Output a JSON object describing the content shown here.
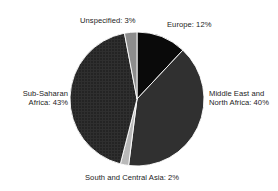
{
  "chart_data": {
    "type": "pie",
    "title": "",
    "subtitle": "",
    "xlabel": "",
    "ylabel": "",
    "legend_position": "none",
    "grid": false,
    "unit": "%",
    "total": 100,
    "start_angle_deg": 0,
    "direction": "clockwise",
    "categories": [
      "Europe",
      "Middle East and North Africa",
      "South and Central Asia",
      "Sub-Saharan Africa",
      "Unspecified"
    ],
    "values": [
      12,
      40,
      2,
      43,
      3
    ],
    "slices": [
      {
        "name": "Europe",
        "label": "Europe: 12%",
        "value": 12,
        "color": "#0a0a0a",
        "pattern": "solid",
        "start_deg": 0,
        "end_deg": 43.2
      },
      {
        "name": "Middle East and North Africa",
        "label_line1": "Middle East and",
        "label_line2": "North Africa: 40%",
        "value": 40,
        "color": "#303030",
        "pattern": "solid",
        "start_deg": 43.2,
        "end_deg": 187.2
      },
      {
        "name": "South and Central Asia",
        "label": "South and Central Asia: 2%",
        "value": 2,
        "color": "#b9b9b9",
        "pattern": "solid",
        "start_deg": 187.2,
        "end_deg": 194.4
      },
      {
        "name": "Sub-Saharan Africa",
        "label_line1": "Sub-Saharan",
        "label_line2": "Africa: 43%",
        "value": 43,
        "color": "#252525",
        "pattern": "crosshatch",
        "start_deg": 194.4,
        "end_deg": 349.2
      },
      {
        "name": "Unspecified",
        "label": "Unspecified: 3%",
        "value": 3,
        "color": "#8d8d8d",
        "pattern": "solid",
        "start_deg": 349.2,
        "end_deg": 360
      }
    ],
    "geometry": {
      "center_x": 137,
      "center_y": 99,
      "radius": 67
    },
    "colors": {
      "background": "#ffffff",
      "text": "#1c1c1c"
    }
  },
  "labels": {
    "unspecified": "Unspecified: 3%",
    "europe": "Europe: 12%",
    "mena_line1": "Middle East and",
    "mena_line2": "North Africa: 40%",
    "ssa_line1": "Sub-Saharan",
    "ssa_line2": "Africa: 43%",
    "sca": "South and Central Asia: 2%"
  }
}
